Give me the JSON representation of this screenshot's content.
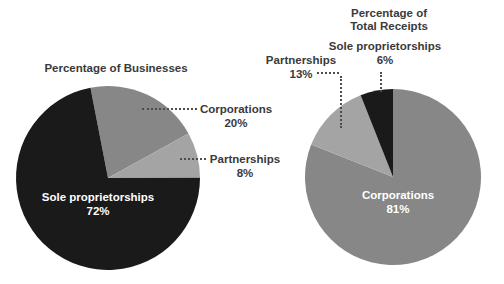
{
  "colors": {
    "background": "#ffffff",
    "text": "#3a3a3a",
    "leader_dots": "#4d4d4d",
    "inside_label": "#ffffff",
    "pie_black": "#1a1a1a",
    "pie_gray": "#878787",
    "pie_light_gray": "#a4a4a4"
  },
  "chart_data": [
    {
      "type": "pie",
      "title": "Percentage of Businesses",
      "legend_position": "callout-labels-with-dotted-leaders",
      "start_angle_deg": -11,
      "categories": [
        "Corporations",
        "Partnerships",
        "Sole proprietorships"
      ],
      "values": [
        20,
        8,
        72
      ],
      "slices": [
        {
          "label": "Corporations",
          "value": 20,
          "pct_label": "20%",
          "color": "#878787",
          "label_placement": "outside-right"
        },
        {
          "label": "Partnerships",
          "value": 8,
          "pct_label": "8%",
          "color": "#a4a4a4",
          "label_placement": "outside-right"
        },
        {
          "label": "Sole proprietorships",
          "value": 72,
          "pct_label": "72%",
          "color": "#1a1a1a",
          "label_placement": "inside",
          "label_color": "#ffffff"
        }
      ]
    },
    {
      "type": "pie",
      "title": "Percentage of Total Receipts",
      "legend_position": "callout-labels-with-dotted-leaders",
      "start_angle_deg": 0,
      "categories": [
        "Corporations",
        "Partnerships",
        "Sole proprietorships"
      ],
      "values": [
        81,
        13,
        6
      ],
      "slices": [
        {
          "label": "Corporations",
          "value": 81,
          "pct_label": "81%",
          "color": "#878787",
          "label_placement": "inside",
          "label_color": "#ffffff"
        },
        {
          "label": "Partnerships",
          "value": 13,
          "pct_label": "13%",
          "color": "#a4a4a4",
          "label_placement": "outside-top"
        },
        {
          "label": "Sole proprietorships",
          "value": 6,
          "pct_label": "6%",
          "color": "#1a1a1a",
          "label_placement": "outside-top"
        }
      ]
    }
  ]
}
